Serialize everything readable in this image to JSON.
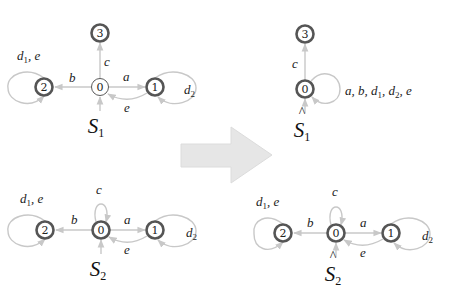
{
  "colors": {
    "edge": "#c8c8c8",
    "node_stroke": "#555555",
    "arrow_fill": "#e6e6e6"
  },
  "systems": [
    {
      "id": "S1",
      "name": "S",
      "name_sub": "1",
      "hat": false,
      "nodes": [
        {
          "id": "0",
          "label": "0",
          "marked": false
        },
        {
          "id": "1",
          "label": "1",
          "marked": true
        },
        {
          "id": "2",
          "label": "2",
          "marked": true
        },
        {
          "id": "3",
          "label": "3",
          "marked": true
        }
      ],
      "edges": [
        {
          "from": "0",
          "to": "3",
          "label": "c"
        },
        {
          "from": "0",
          "to": "2",
          "label": "b"
        },
        {
          "from": "0",
          "to": "1",
          "label": "a"
        },
        {
          "from": "1",
          "to": "0",
          "label": "e"
        },
        {
          "from": "2",
          "to": "2",
          "label": "d1, e"
        },
        {
          "from": "1",
          "to": "1",
          "label": "d2"
        }
      ]
    },
    {
      "id": "S1hat",
      "name": "S",
      "name_sub": "1",
      "hat": true,
      "nodes": [
        {
          "id": "0",
          "label": "0",
          "marked": true
        },
        {
          "id": "3",
          "label": "3",
          "marked": true
        }
      ],
      "edges": [
        {
          "from": "0",
          "to": "3",
          "label": "c"
        },
        {
          "from": "0",
          "to": "0",
          "label": "a, b, d1, d2, e"
        }
      ]
    },
    {
      "id": "S2",
      "name": "S",
      "name_sub": "2",
      "hat": false,
      "nodes": [
        {
          "id": "0",
          "label": "0",
          "marked": true
        },
        {
          "id": "1",
          "label": "1",
          "marked": true
        },
        {
          "id": "2",
          "label": "2",
          "marked": true
        }
      ],
      "edges": [
        {
          "from": "0",
          "to": "0",
          "label": "c"
        },
        {
          "from": "0",
          "to": "2",
          "label": "b"
        },
        {
          "from": "0",
          "to": "1",
          "label": "a"
        },
        {
          "from": "1",
          "to": "0",
          "label": "e"
        },
        {
          "from": "2",
          "to": "2",
          "label": "d1, e"
        },
        {
          "from": "1",
          "to": "1",
          "label": "d2"
        }
      ]
    },
    {
      "id": "S2hat",
      "name": "S",
      "name_sub": "2",
      "hat": true,
      "nodes": [
        {
          "id": "0",
          "label": "0",
          "marked": true
        },
        {
          "id": "1",
          "label": "1",
          "marked": true
        },
        {
          "id": "2",
          "label": "2",
          "marked": true
        }
      ],
      "edges": [
        {
          "from": "0",
          "to": "0",
          "label": "c"
        },
        {
          "from": "0",
          "to": "2",
          "label": "b"
        },
        {
          "from": "0",
          "to": "1",
          "label": "a"
        },
        {
          "from": "1",
          "to": "0",
          "label": "e"
        },
        {
          "from": "2",
          "to": "2",
          "label": "d1, e"
        },
        {
          "from": "1",
          "to": "1",
          "label": "d2"
        }
      ]
    }
  ],
  "labels": {
    "s1": {
      "n0": "0",
      "n1": "1",
      "n2": "2",
      "n3": "3",
      "a": "a",
      "b": "b",
      "c": "c",
      "e": "e",
      "d": "d",
      "d1": "1",
      "d2": "2",
      "comma_e": ", e",
      "name": "S",
      "sub": "1"
    },
    "s1hat": {
      "n0": "0",
      "n3": "3",
      "c": "c",
      "loop_a": "a, b, ",
      "d": "d",
      "d1": "1",
      "comma": ", ",
      "d2": "2",
      "comma_e": ", e",
      "name": "S",
      "hat": "^",
      "sub": "1"
    },
    "s2": {
      "n0": "0",
      "n1": "1",
      "n2": "2",
      "a": "a",
      "b": "b",
      "c": "c",
      "e": "e",
      "d": "d",
      "d1": "1",
      "d2": "2",
      "comma_e": ", e",
      "name": "S",
      "sub": "2"
    },
    "s2hat": {
      "n0": "0",
      "n1": "1",
      "n2": "2",
      "a": "a",
      "b": "b",
      "c": "c",
      "e": "e",
      "d": "d",
      "d1": "1",
      "d2": "2",
      "comma_e": ", e",
      "name": "S",
      "hat": "^",
      "sub": "2"
    }
  },
  "transform_arrow": {
    "direction": "right"
  }
}
